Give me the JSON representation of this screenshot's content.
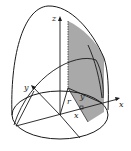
{
  "diagram": {
    "type": "3d-solid-cross-section",
    "labels": {
      "z_axis": "z",
      "y_axis": "y",
      "x_axis": "x",
      "radius": "r",
      "y_coord": "y",
      "x_coord": "x"
    },
    "colors": {
      "stroke": "#1a1a1a",
      "shade": "#9a9a9a",
      "background": "#ffffff"
    }
  }
}
